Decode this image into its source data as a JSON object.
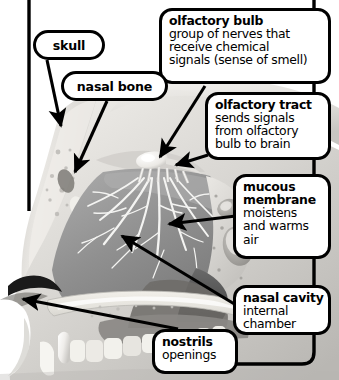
{
  "diagram": {
    "frame_color": "#000000",
    "background_color": "#ffffff"
  },
  "callouts": [
    {
      "id": "olfactory-bulb",
      "title": "olfactory bulb",
      "description_lines": [
        "group of nerves that",
        "receive chemical",
        "signals (sense of smell)"
      ]
    },
    {
      "id": "olfactory-tract",
      "title": "olfactory tract",
      "description_lines": [
        "sends signals",
        "from olfactory",
        "bulb to brain"
      ]
    },
    {
      "id": "mucous-membrane",
      "title_lines": [
        "mucous",
        "membrane"
      ],
      "title": "mucous membrane",
      "description_lines": [
        "moistens",
        "and warms",
        "air"
      ]
    },
    {
      "id": "nasal-cavity",
      "title": "nasal cavity",
      "description_lines": [
        "internal",
        "chamber"
      ]
    },
    {
      "id": "nostrils",
      "title": "nostrils",
      "description_lines": [
        "openings"
      ]
    }
  ],
  "pills": [
    {
      "id": "skull",
      "label": "skull"
    },
    {
      "id": "nasal-bone",
      "label": "nasal bone"
    }
  ],
  "artwork": {
    "style": "grayscale medical illustration",
    "tones": {
      "bone_light": "#e8e6e2",
      "tissue_mid": "#9a9a9a",
      "tissue_dark": "#6f6f6f",
      "cavity_shadow": "#4a4a4a",
      "nerve_white": "#f4f4f2",
      "tooth_white": "#f2f1ec"
    },
    "features": [
      "skull bone margin",
      "nasal bone",
      "olfactory bulb",
      "olfactory nerve fibers",
      "mucous membrane turbinates",
      "nasal cavity",
      "hard palate",
      "upper teeth",
      "nostril opening"
    ]
  }
}
